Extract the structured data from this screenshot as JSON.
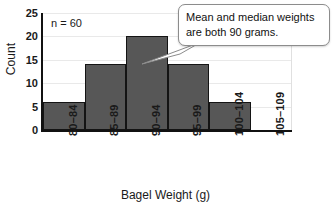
{
  "chart_data": {
    "type": "bar",
    "title": "",
    "subtitle": "",
    "xlabel": "Bagel Weight (g)",
    "ylabel": "Count",
    "categories": [
      "80–84",
      "85–89",
      "90–94",
      "95–99",
      "100–104",
      "105–109"
    ],
    "values": [
      6,
      14,
      20,
      14,
      6,
      0
    ],
    "ylim": [
      0,
      25
    ],
    "yticks": [
      0,
      5,
      10,
      15,
      20,
      25
    ],
    "ytick_labels": [
      "0",
      "5",
      "10",
      "15",
      "20",
      "25"
    ],
    "grid": true,
    "grid_axis": "y",
    "legend": false,
    "legend_position": "none",
    "bar_color": "#575757",
    "bar_edge_color": "#141414",
    "axis_color": "#111111",
    "gridline_color": "#e9e9e9",
    "annotations": [
      {
        "name": "sample-size",
        "text": "n = 60",
        "position": "inside-top-left"
      },
      {
        "name": "mean-median-callout",
        "text": "Mean and median weights are both 90 grams.",
        "line1": "Mean and median weights",
        "line2": "are both 90 grams.",
        "points_to_category": "90–94",
        "position": "top-right"
      }
    ]
  },
  "labels": {
    "ylabel": "Count",
    "xlabel": "Bagel Weight (g)",
    "n_label": "n = 60",
    "callout_line1": "Mean and median weights",
    "callout_line2": "are both 90 grams."
  }
}
